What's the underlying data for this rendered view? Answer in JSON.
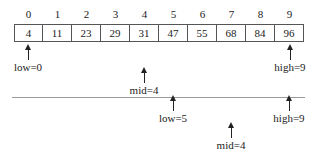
{
  "diagram": {
    "title": "",
    "array": {
      "indices": [
        "0",
        "1",
        "2",
        "3",
        "4",
        "5",
        "6",
        "7",
        "8",
        "9"
      ],
      "values": [
        "4",
        "11",
        "23",
        "29",
        "31",
        "47",
        "55",
        "68",
        "84",
        "96"
      ]
    },
    "step1": {
      "low_label": "low=0",
      "high_label": "high=9",
      "mid_label": "mid=4"
    },
    "step2": {
      "low_label": "low=5",
      "high_label": "high=9",
      "mid_label": "mid=4"
    }
  }
}
